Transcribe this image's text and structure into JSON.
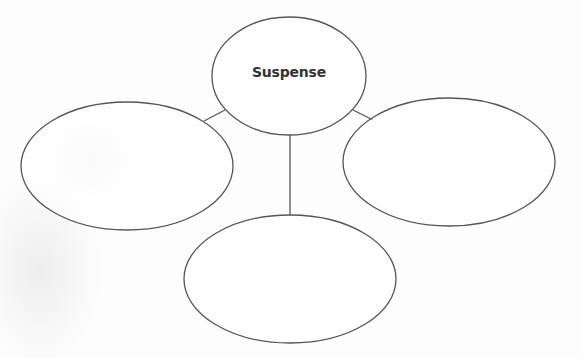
{
  "diagram": {
    "type": "bubble-map",
    "center": {
      "label": "Suspense"
    },
    "branches": [
      {
        "position": "left",
        "label": ""
      },
      {
        "position": "right",
        "label": ""
      },
      {
        "position": "bottom",
        "label": ""
      }
    ],
    "colors": {
      "stroke": "#555555",
      "text": "#333333",
      "background": "#ffffff"
    }
  }
}
